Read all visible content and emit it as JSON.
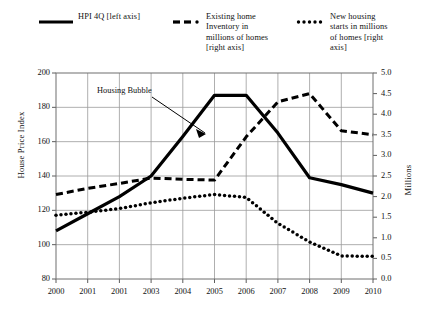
{
  "chart_data": {
    "type": "line",
    "title": "",
    "xlabel": "",
    "ylabel": "House Price Index",
    "y2label": "Millions",
    "ylim": [
      80,
      200
    ],
    "y2lim": [
      0.0,
      5.0
    ],
    "grid": true,
    "legend_position": "top",
    "x_tick_labels": [
      "2000",
      "2001",
      "2001",
      "2003",
      "2004",
      "2005",
      "2006",
      "2007",
      "2008",
      "2009",
      "2010"
    ],
    "y_tick_labels": [
      "80",
      "100",
      "120",
      "140",
      "160",
      "180",
      "200"
    ],
    "y2_tick_labels": [
      "0.0",
      "0.5",
      "1.0",
      "1.5",
      "2.0",
      "2.5",
      "3.0",
      "3.5",
      "4.0",
      "4.5",
      "5.0"
    ],
    "x": [
      2000,
      2001,
      2002,
      2003,
      2004,
      2005,
      2006,
      2007,
      2008,
      2009,
      2010
    ],
    "series": [
      {
        "name": "HPI 4Q  [left axis]",
        "axis": "left",
        "style": "solid",
        "values": [
          108,
          118,
          128,
          140,
          163,
          187,
          187,
          165,
          139,
          135,
          130
        ]
      },
      {
        "name": "Existing home Inventory in millions of homes [right axis]",
        "axis": "right",
        "style": "dashed",
        "values": [
          2.05,
          2.2,
          2.32,
          2.45,
          2.42,
          2.4,
          3.45,
          4.3,
          4.5,
          3.6,
          3.5
        ]
      },
      {
        "name": "New housing starts in millions of homes [right axis]",
        "axis": "right",
        "style": "dotted",
        "values": [
          1.55,
          1.62,
          1.71,
          1.85,
          1.96,
          2.05,
          1.98,
          1.35,
          0.9,
          0.56,
          0.55
        ]
      }
    ],
    "annotations": [
      {
        "text": "Housing Bubble",
        "points_to_series": "HPI 4Q  [left axis]"
      }
    ]
  },
  "legend": {
    "hpi": {
      "label": "HPI 4Q  [left axis]",
      "key": "solid-line-key"
    },
    "inventory": {
      "label": "Existing home\nInventory in\nmillions of homes\n[right axis]",
      "key": "dashed-line-key"
    },
    "starts": {
      "label": "New housing\nstarts in millions\nof homes [right\naxis]",
      "key": "dotted-line-key"
    }
  },
  "axes": {
    "left_title": "House Price Index",
    "right_title": "Millions"
  },
  "annotation": {
    "housing_bubble": "Housing Bubble"
  }
}
